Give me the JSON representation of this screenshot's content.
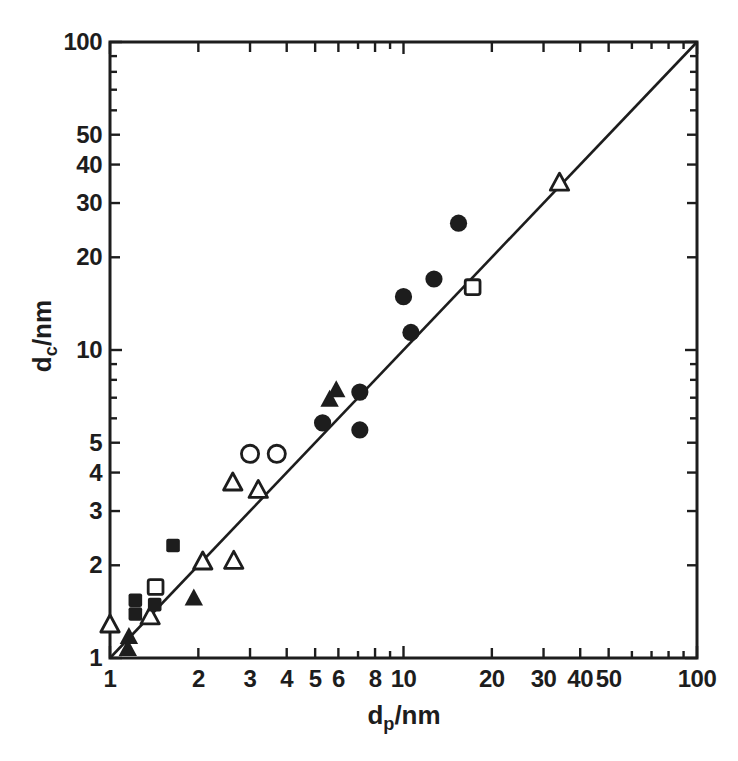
{
  "figure": {
    "ink_color": "#1d1d1d",
    "paper_color": "#ffffff"
  },
  "chart_data": {
    "type": "scatter",
    "title": "",
    "xlabel": {
      "base": "d",
      "sub": "p",
      "rest": "/nm"
    },
    "ylabel": {
      "base": "d",
      "sub": "c",
      "rest": "/nm"
    },
    "xlim": [
      1,
      100
    ],
    "ylim": [
      1,
      100
    ],
    "grid": false,
    "legend": "none",
    "x_axis": {
      "scale": "log",
      "ticks": [
        1,
        2,
        3,
        4,
        5,
        6,
        7,
        8,
        9,
        10,
        20,
        30,
        40,
        50,
        60,
        70,
        80,
        90,
        100
      ],
      "labeled_ticks": [
        1,
        2,
        3,
        4,
        5,
        6,
        8,
        10,
        20,
        30,
        40,
        50,
        100
      ]
    },
    "y_axis": {
      "scale": "log",
      "ticks": [
        1,
        2,
        3,
        4,
        5,
        6,
        7,
        8,
        9,
        10,
        20,
        30,
        40,
        50,
        60,
        70,
        80,
        90,
        100
      ],
      "labeled_ticks": [
        1,
        2,
        3,
        4,
        5,
        10,
        20,
        30,
        40,
        50,
        100
      ]
    },
    "identity_line": {
      "from": [
        1,
        1
      ],
      "to": [
        100,
        100
      ]
    },
    "series": [
      {
        "name": "filled-circle",
        "marker": "circle",
        "variant": "filled",
        "points": [
          [
            5.3,
            5.8
          ],
          [
            7.1,
            7.3
          ],
          [
            7.1,
            5.5
          ],
          [
            10.6,
            11.4
          ],
          [
            10.0,
            14.9
          ],
          [
            12.7,
            17.0
          ],
          [
            15.4,
            25.8
          ]
        ]
      },
      {
        "name": "open-circle",
        "marker": "circle",
        "variant": "open",
        "points": [
          [
            3.0,
            4.6
          ],
          [
            3.7,
            4.6
          ]
        ]
      },
      {
        "name": "filled-triangle",
        "marker": "triangle",
        "variant": "filled",
        "points": [
          [
            1.16,
            1.17
          ],
          [
            1.15,
            1.07
          ],
          [
            1.93,
            1.56
          ],
          [
            5.6,
            6.9
          ],
          [
            5.9,
            7.4
          ]
        ]
      },
      {
        "name": "open-triangle",
        "marker": "triangle",
        "variant": "open",
        "points": [
          [
            1.0,
            1.28
          ],
          [
            1.37,
            1.36
          ],
          [
            2.07,
            2.05
          ],
          [
            2.64,
            2.06
          ],
          [
            2.62,
            3.7
          ],
          [
            3.2,
            3.5
          ],
          [
            34,
            34.8
          ]
        ]
      },
      {
        "name": "filled-square",
        "marker": "square",
        "variant": "filled",
        "points": [
          [
            1.22,
            1.54
          ],
          [
            1.22,
            1.39
          ],
          [
            1.42,
            1.49
          ],
          [
            1.64,
            2.32
          ]
        ]
      },
      {
        "name": "open-square",
        "marker": "square",
        "variant": "open",
        "points": [
          [
            1.43,
            1.7
          ],
          [
            17.2,
            16.0
          ]
        ]
      }
    ]
  }
}
